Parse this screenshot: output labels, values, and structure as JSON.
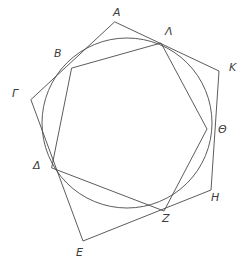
{
  "figure": {
    "stroke_color": "#4a4a4a",
    "background_color": "#ffffff",
    "label_color": "#3c3c3c"
  },
  "labels": {
    "A": "A",
    "B": "B",
    "Gamma": "Γ",
    "Delta": "Δ",
    "E": "E",
    "Z": "Z",
    "H": "H",
    "Theta": "Θ",
    "K": "K",
    "Lambda": "Λ"
  },
  "chart_data": {
    "type": "diagram",
    "units": "pixels",
    "viewbox": [
      0,
      0,
      251,
      272
    ],
    "circle": {
      "center": [
        127,
        123
      ],
      "radius": 85,
      "label": "inscribed circle"
    },
    "outer_pentagon": {
      "name": "circumscribed pentagon",
      "vertices": [
        {
          "label": "A",
          "point": [
            115,
            22
          ]
        },
        {
          "label": "K",
          "point": [
            219,
            71
          ]
        },
        {
          "label": "H",
          "point": [
            211,
            190
          ]
        },
        {
          "label": "E",
          "point": [
            83,
            241
          ]
        },
        {
          "label": "Γ",
          "point": [
            31,
            100
          ]
        }
      ],
      "closed": true
    },
    "inner_pentagon": {
      "name": "inscribed pentagon (tangent points)",
      "vertices": [
        {
          "label": "B",
          "point": [
            72,
            68
          ]
        },
        {
          "label": "Λ",
          "point": [
            161,
            43
          ]
        },
        {
          "label": "Θ",
          "point": [
            207,
            129
          ]
        },
        {
          "label": "Z",
          "point": [
            164,
            211
          ]
        },
        {
          "label": "Δ",
          "point": [
            52,
            168
          ]
        }
      ],
      "closed": true
    },
    "label_positions": [
      {
        "label": "A",
        "x": 113,
        "y": 7
      },
      {
        "label": "Λ",
        "x": 165,
        "y": 26
      },
      {
        "label": "B",
        "x": 54,
        "y": 48
      },
      {
        "label": "K",
        "x": 229,
        "y": 62
      },
      {
        "label": "Γ",
        "x": 12,
        "y": 88
      },
      {
        "label": "Θ",
        "x": 218,
        "y": 124
      },
      {
        "label": "Δ",
        "x": 33,
        "y": 160
      },
      {
        "label": "H",
        "x": 211,
        "y": 192
      },
      {
        "label": "Z",
        "x": 162,
        "y": 213
      },
      {
        "label": "E",
        "x": 76,
        "y": 247
      }
    ]
  }
}
